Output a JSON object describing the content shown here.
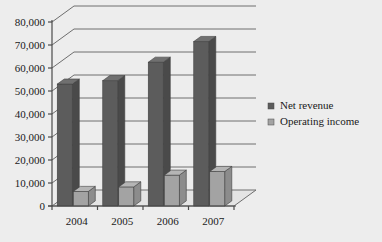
{
  "chart_data": {
    "type": "bar",
    "title": "",
    "subtitle": "",
    "xlabel": "",
    "ylabel": "",
    "categories": [
      "2004",
      "2005",
      "2006",
      "2007"
    ],
    "series": [
      {
        "name": "Net revenue",
        "values": [
          53000,
          54500,
          62500,
          71500
        ],
        "color": "#5c5c5c"
      },
      {
        "name": "Operating income",
        "values": [
          6300,
          8300,
          13400,
          15000
        ],
        "color": "#a3a3a3"
      }
    ],
    "ylim": [
      0,
      80000
    ],
    "yticks": [
      0,
      10000,
      20000,
      30000,
      40000,
      50000,
      60000,
      70000,
      80000
    ],
    "ytick_labels": [
      "0",
      "10,000",
      "20,000",
      "30,000",
      "40,000",
      "50,000",
      "60,000",
      "70,000",
      "80,000"
    ],
    "grid": true,
    "legend_position": "right",
    "style": "3d-column",
    "background_color": "#ededed",
    "axis_color": "#4a4a4a",
    "grid_color": "#6e6e6e",
    "text_color": "#1a1a1a"
  },
  "legend": {
    "items": [
      {
        "label": "Net revenue",
        "marker": "square-marker",
        "color": "#5c5c5c"
      },
      {
        "label": "Operating income",
        "marker": "square-marker",
        "color": "#a3a3a3"
      }
    ]
  },
  "axes": {
    "y_tick_labels": [
      "80,000",
      "70,000",
      "60,000",
      "50,000",
      "40,000",
      "30,000",
      "20,000",
      "10,000",
      "0"
    ],
    "x_tick_labels": [
      "2004",
      "2005",
      "2006",
      "2007"
    ]
  }
}
